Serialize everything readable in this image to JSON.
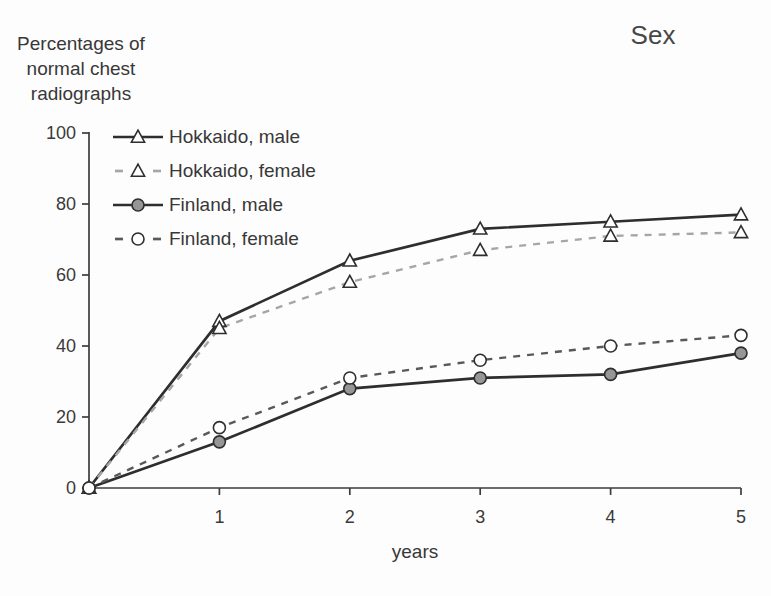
{
  "page": {
    "y_axis_title": "Percentages of\nnormal chest\nradiographs",
    "chart_title": "Sex",
    "x_axis_label": "years"
  },
  "chart_data": {
    "type": "line",
    "title": "Sex",
    "xlabel": "years",
    "ylabel": "Percentages of normal chest radiographs",
    "x": [
      0,
      1,
      2,
      3,
      4,
      5
    ],
    "series": [
      {
        "name": "Hokkaido, male",
        "values": [
          0,
          47,
          64,
          73,
          75,
          77
        ],
        "line": "solid",
        "marker": "open-triangle",
        "color": "#2e2e2e"
      },
      {
        "name": "Hokkaido, female",
        "values": [
          0,
          45,
          58,
          67,
          71,
          72
        ],
        "line": "dashed",
        "marker": "open-triangle",
        "color": "#a6a6a6"
      },
      {
        "name": "Finland, male",
        "values": [
          0,
          13,
          28,
          31,
          32,
          38
        ],
        "line": "solid",
        "marker": "filled-circle",
        "color": "#2e2e2e",
        "marker_fill": "#969696"
      },
      {
        "name": "Finland, female",
        "values": [
          0,
          17,
          31,
          36,
          40,
          43
        ],
        "line": "dashed",
        "marker": "open-circle",
        "color": "#595959"
      }
    ],
    "xlim": [
      0,
      5
    ],
    "ylim": [
      0,
      100
    ],
    "xticks": [
      1,
      2,
      3,
      4,
      5
    ],
    "yticks": [
      0,
      20,
      40,
      60,
      80,
      100
    ],
    "grid": false,
    "legend_position": "top-left-inside",
    "axis_color": "#3d3d3d",
    "text_color": "#3a3a3a",
    "marker_stroke": "#2e2e2e",
    "marker_open_fill": "#ffffff"
  }
}
